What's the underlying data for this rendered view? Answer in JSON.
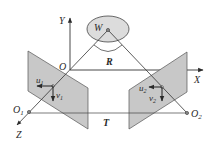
{
  "diagram": {
    "labels": {
      "world_point": "W",
      "origin": "O",
      "axis_x": "X",
      "axis_y": "Y",
      "axis_z": "Z",
      "rotation": "R",
      "translation": "T",
      "camera1_center": "O",
      "camera1_sub": "1",
      "camera2_center": "O",
      "camera2_sub": "2",
      "u1": "u",
      "u1_sub": "1",
      "v1": "v",
      "v1_sub": "1",
      "u2": "u",
      "u2_sub": "2",
      "v2": "v",
      "v2_sub": "2"
    },
    "colors": {
      "line": "#3a3a3a",
      "plane_fill": "#c8c8c8",
      "ellipse_fill": "#d9d9d9",
      "text": "#2a2a2a"
    }
  }
}
